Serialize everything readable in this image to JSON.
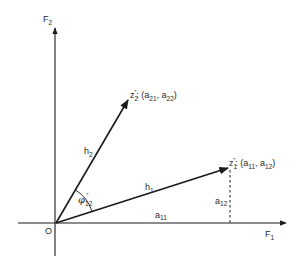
{
  "diagram": {
    "type": "vector-geometry",
    "axes": {
      "horizontal": {
        "label": "F",
        "subscript": "1"
      },
      "vertical": {
        "label": "F",
        "subscript": "2"
      },
      "origin_label": "O"
    },
    "vectors": [
      {
        "name": "z1",
        "point_label": "z",
        "point_sub": "1",
        "point_sup": "″",
        "coords_text": ": (a",
        "coord1_sub": "11",
        "sep": ", a",
        "coord2_sub": "12",
        "close": ")",
        "length_label": "h",
        "length_sub": "1"
      },
      {
        "name": "z2",
        "point_label": "z",
        "point_sub": "2",
        "point_sup": "″",
        "coords_text": ": (a",
        "coord1_sub": "21",
        "sep": ", a",
        "coord2_sub": "22",
        "close": ")",
        "length_label": "h",
        "length_sub": "2"
      }
    ],
    "projections": {
      "a11": {
        "label": "a",
        "sub": "11"
      },
      "a12": {
        "label": "a",
        "sub": "12"
      }
    },
    "angle": {
      "label": "φ",
      "sub": "12",
      "sup": "″"
    },
    "colors": {
      "line": "#1a1a1a",
      "text": "#2a2a2a",
      "background": "#ffffff"
    }
  }
}
